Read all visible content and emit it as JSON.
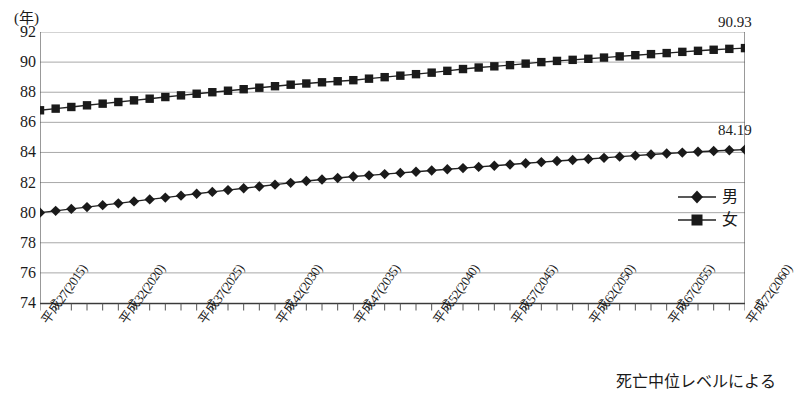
{
  "chart_data": {
    "type": "line",
    "title": "",
    "xlabel": "",
    "ylabel": "(年)",
    "unit_label": "(年)",
    "ylim": [
      74,
      92
    ],
    "yticks": [
      74,
      76,
      78,
      80,
      82,
      84,
      86,
      88,
      90,
      92
    ],
    "grid": true,
    "legend_position": "right-middle",
    "x_start_year": 2015,
    "x_end_year": 2060,
    "x_tick_labels": [
      {
        "year": 2015,
        "label": "平成27(2015)"
      },
      {
        "year": 2020,
        "label": "平成32(2020)"
      },
      {
        "year": 2025,
        "label": "平成37(2025)"
      },
      {
        "year": 2030,
        "label": "平成42(2030)"
      },
      {
        "year": 2035,
        "label": "平成47(2035)"
      },
      {
        "year": 2040,
        "label": "平成52(2040)"
      },
      {
        "year": 2045,
        "label": "平成57(2045)"
      },
      {
        "year": 2050,
        "label": "平成62(2050)"
      },
      {
        "year": 2055,
        "label": "平成67(2055)"
      },
      {
        "year": 2060,
        "label": "平成72(2060)"
      }
    ],
    "x": [
      2015,
      2016,
      2017,
      2018,
      2019,
      2020,
      2021,
      2022,
      2023,
      2024,
      2025,
      2026,
      2027,
      2028,
      2029,
      2030,
      2031,
      2032,
      2033,
      2034,
      2035,
      2036,
      2037,
      2038,
      2039,
      2040,
      2041,
      2042,
      2043,
      2044,
      2045,
      2046,
      2047,
      2048,
      2049,
      2050,
      2051,
      2052,
      2053,
      2054,
      2055,
      2056,
      2057,
      2058,
      2059,
      2060
    ],
    "series": [
      {
        "name": "男",
        "marker": "diamond",
        "end_value_label": "84.19",
        "values": [
          80.0,
          80.12,
          80.25,
          80.37,
          80.5,
          80.62,
          80.75,
          80.88,
          81.0,
          81.13,
          81.26,
          81.38,
          81.5,
          81.62,
          81.74,
          81.86,
          81.98,
          82.1,
          82.2,
          82.3,
          82.4,
          82.48,
          82.56,
          82.64,
          82.72,
          82.8,
          82.88,
          82.96,
          83.04,
          83.12,
          83.2,
          83.28,
          83.36,
          83.43,
          83.5,
          83.56,
          83.64,
          83.72,
          83.79,
          83.86,
          83.93,
          83.99,
          84.05,
          84.1,
          84.15,
          84.19
        ]
      },
      {
        "name": "女",
        "marker": "square",
        "end_value_label": "90.93",
        "values": [
          86.8,
          86.91,
          87.02,
          87.13,
          87.24,
          87.35,
          87.46,
          87.57,
          87.68,
          87.79,
          87.9,
          88.0,
          88.1,
          88.2,
          88.3,
          88.4,
          88.5,
          88.58,
          88.66,
          88.73,
          88.8,
          88.9,
          89.0,
          89.1,
          89.2,
          89.3,
          89.42,
          89.54,
          89.64,
          89.72,
          89.8,
          89.9,
          90.0,
          90.08,
          90.15,
          90.22,
          90.3,
          90.38,
          90.46,
          90.53,
          90.6,
          90.68,
          90.75,
          90.82,
          90.88,
          90.93
        ]
      }
    ],
    "annotations": [
      {
        "name": "female-end-value",
        "text": "90.93"
      },
      {
        "name": "male-end-value",
        "text": "84.19"
      }
    ],
    "footnote": "死亡中位レベルによる"
  },
  "colors": {
    "series_line": "#222222",
    "marker": "#1a1a1a",
    "gridline": "#a8a8a8",
    "axis": "#555555",
    "text": "#1a1a1a"
  }
}
